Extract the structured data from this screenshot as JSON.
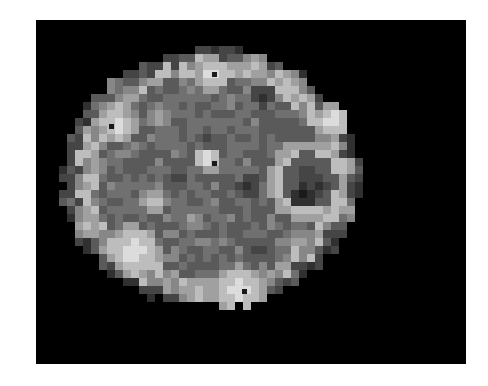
{
  "image": {
    "description": "Grayscale pixelated brain scan slice (PET/SPECT-like) on black background",
    "background": "#ffffff",
    "frame_color": "#000000",
    "palette": [
      "#000000",
      "#1a1a1a",
      "#303030",
      "#454545",
      "#5a5a5a",
      "#707070",
      "#878787",
      "#a0a0a0",
      "#bdbdbd",
      "#dcdcdc"
    ],
    "cell_size": 8,
    "grid_rows": [
      "00000000000000000000000000000000000000",
      "00000000000000000000000000000000000000",
      "00000000000000000000000000000000000000",
      "00000000000000000000000000000000000000",
      "00000000000000000000000000000000000000",
      "00000000000000000000000000000000000000",
      "00000000000000000000000000000000000000",
      "00000000000000000000000000000000000000",
      "00000000000000000000000000000000000000",
      "00000000000000000000000000000000000000",
      "00000000000000000000000000000000000000",
      "00000000000000000000000000000000000000",
      "00000000000000000000000000000000000000",
      "00000000000000000000000000000000000000",
      "00000000000000000000000000000000000000",
      "00000000000000000000000000000000000000",
      "00000000000000000000000000000000000000",
      "00000000000000000000000000000000000000",
      "00000000000000000000000000000000000000",
      "00000000000000000000000000000000000000",
      "00000000000000000000000000000000000000",
      "00000000000000000000000000000000000000",
      "00000000000000000000000000000000000000",
      "00000000000000000000000000000000000000",
      "00000000000000000000000000000000000000",
      "00000000000000000000000000000000000000",
      "00000000000000000000000000000000000000",
      "00000000000000000000000000000000000000",
      "00000000000000000000000000000000000000",
      "00000000000000000000000000000000000000",
      "00000000000000000000000000000000000000",
      "00000000000000000000000000000000000000",
      "00000000000000000000000000000000000000"
    ],
    "ellipse": {
      "cx": 152,
      "cy": 132,
      "rx": 150,
      "ry": 130
    },
    "hotspots": [
      {
        "x": 155,
        "y": 28,
        "r": 18,
        "level": 9
      },
      {
        "x": 195,
        "y": 22,
        "r": 14,
        "level": 8
      },
      {
        "x": 230,
        "y": 40,
        "r": 16,
        "level": 8
      },
      {
        "x": 60,
        "y": 80,
        "r": 18,
        "level": 9
      },
      {
        "x": 100,
        "y": 70,
        "r": 16,
        "level": 7
      },
      {
        "x": 35,
        "y": 120,
        "r": 14,
        "level": 7
      },
      {
        "x": 150,
        "y": 112,
        "r": 14,
        "level": 9
      },
      {
        "x": 95,
        "y": 155,
        "r": 14,
        "level": 8
      },
      {
        "x": 75,
        "y": 205,
        "r": 26,
        "level": 9
      },
      {
        "x": 30,
        "y": 180,
        "r": 14,
        "level": 8
      },
      {
        "x": 180,
        "y": 245,
        "r": 26,
        "level": 9
      },
      {
        "x": 140,
        "y": 250,
        "r": 18,
        "level": 8
      },
      {
        "x": 275,
        "y": 75,
        "r": 18,
        "level": 9
      },
      {
        "x": 285,
        "y": 120,
        "r": 12,
        "level": 8
      },
      {
        "x": 250,
        "y": 135,
        "r": 42,
        "level": 9
      },
      {
        "x": 240,
        "y": 195,
        "r": 16,
        "level": 7
      },
      {
        "x": 290,
        "y": 165,
        "r": 10,
        "level": 7
      },
      {
        "x": 135,
        "y": 175,
        "r": 12,
        "level": 7
      },
      {
        "x": 50,
        "y": 40,
        "r": 14,
        "level": 6
      }
    ],
    "darkspots": [
      {
        "x": 250,
        "y": 135,
        "r": 28,
        "level": 3
      },
      {
        "x": 245,
        "y": 150,
        "r": 12,
        "level": 1
      },
      {
        "x": 260,
        "y": 140,
        "r": 10,
        "level": 2
      },
      {
        "x": 205,
        "y": 50,
        "r": 12,
        "level": 2
      },
      {
        "x": 190,
        "y": 140,
        "r": 12,
        "level": 2
      },
      {
        "x": 120,
        "y": 135,
        "r": 12,
        "level": 3
      },
      {
        "x": 200,
        "y": 205,
        "r": 14,
        "level": 3
      },
      {
        "x": 150,
        "y": 95,
        "r": 8,
        "level": 3
      }
    ],
    "dots": [
      {
        "x": 155,
        "y": 28
      },
      {
        "x": 52,
        "y": 80
      },
      {
        "x": 155,
        "y": 117
      },
      {
        "x": 185,
        "y": 245
      }
    ]
  }
}
